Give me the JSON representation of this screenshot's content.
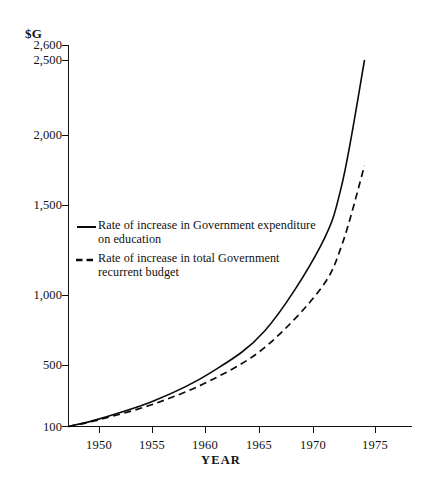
{
  "chart_data": {
    "type": "line",
    "title": "",
    "xlabel": "YEAR",
    "ylabel": "$G",
    "unit_label": "$G",
    "xlim": [
      1947,
      1977.5
    ],
    "ylim": [
      100,
      2600
    ],
    "grid": false,
    "legend_position": "inside-left-middle",
    "x_ticks": [
      "1950",
      "1955",
      "1960",
      "1965",
      "1970",
      "1975"
    ],
    "x_tick_values": [
      1950,
      1955,
      1960,
      1965,
      1970,
      1975
    ],
    "y_ticks": [
      "100",
      "500",
      "1,000",
      "1,500",
      "2,000",
      "2,500",
      "2,600"
    ],
    "y_tick_values": [
      100,
      500,
      1000,
      1500,
      2000,
      2500,
      2600
    ],
    "x": [
      1947,
      1950,
      1955,
      1960,
      1965,
      1970,
      1972,
      1974
    ],
    "series": [
      {
        "name": "Rate of increase in Government expenditure on education",
        "style": "solid",
        "values": [
          100,
          150,
          270,
          450,
          730,
          1280,
          1700,
          2500
        ]
      },
      {
        "name": "Rate of increase in total Government recurrent budget",
        "style": "dashed",
        "values": [
          100,
          145,
          250,
          400,
          620,
          1000,
          1300,
          1810
        ]
      }
    ],
    "annotations": []
  },
  "legend": {
    "entries": [
      {
        "style": "solid",
        "line1": "Rate of increase in Government expenditure",
        "line2": "on education"
      },
      {
        "style": "dashed",
        "line1": "Rate of increase in total Government",
        "line2": "recurrent  budget"
      }
    ]
  },
  "colors": {
    "ink": "#111111",
    "background": "#ffffff"
  }
}
